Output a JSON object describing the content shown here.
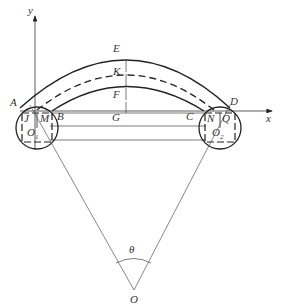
{
  "diagram": {
    "axes": {
      "x_label": "x",
      "y_label": "y"
    },
    "points": {
      "A": "A",
      "B": "B",
      "C": "C",
      "D": "D",
      "E": "E",
      "F": "F",
      "G": "G",
      "K": "K",
      "J": "J",
      "M": "M",
      "N": "N",
      "Q": "Q",
      "O": "O",
      "O1": "O",
      "O1_sub": "1",
      "O2": "O",
      "O2_sub": "2"
    },
    "angle_label": "θ",
    "colors": {
      "line": "#222222",
      "thin": "#555555",
      "background": "#ffffff"
    }
  }
}
